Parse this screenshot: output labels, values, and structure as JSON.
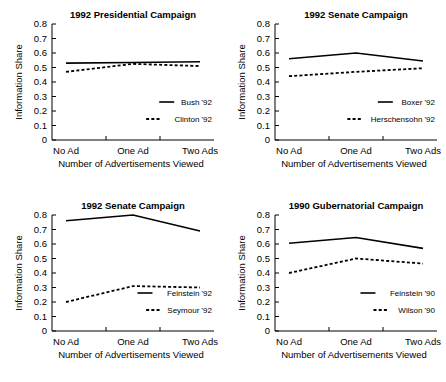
{
  "figure": {
    "panel_count": 4,
    "shared_xlabel": "Number of Advertisements Viewed",
    "shared_ylabel": "Information Share",
    "shared_categories": [
      "No Ad",
      "One Ad",
      "Two Ads"
    ],
    "shared_yticks": [
      "0",
      "0.1",
      "0.2",
      "0.3",
      "0.4",
      "0.5",
      "0.6",
      "0.7",
      "0.8"
    ],
    "line_color": "#000000",
    "background_color": "#ffffff"
  },
  "chart_data": [
    {
      "type": "line",
      "title": "1992 Presidential Campaign",
      "xlabel": "Number of Advertisements Viewed",
      "ylabel": "Information Share",
      "categories": [
        "No Ad",
        "One Ad",
        "Two Ads"
      ],
      "ylim": [
        0,
        0.8
      ],
      "yticks": [
        0,
        0.1,
        0.2,
        0.3,
        0.4,
        0.5,
        0.6,
        0.7,
        0.8
      ],
      "ytick_labels": [
        "0",
        "0.1",
        "0.2",
        "0.3",
        "0.4",
        "0.5",
        "0.6",
        "0.7",
        "0.8"
      ],
      "grid": false,
      "legend_position": "lower right inside",
      "series": [
        {
          "name": "Bush '92",
          "style": "solid",
          "values": [
            0.53,
            0.535,
            0.54
          ]
        },
        {
          "name": "Clinton '92",
          "style": "dashed",
          "values": [
            0.47,
            0.525,
            0.51
          ]
        }
      ]
    },
    {
      "type": "line",
      "title": "1992 Senate Campaign",
      "xlabel": "Number of Advertisements Viewed",
      "ylabel": "Information Share",
      "categories": [
        "No Ad",
        "One Ad",
        "Two Ads"
      ],
      "ylim": [
        0,
        0.8
      ],
      "yticks": [
        0,
        0.1,
        0.2,
        0.3,
        0.4,
        0.5,
        0.6,
        0.7,
        0.8
      ],
      "ytick_labels": [
        "0",
        "0.1",
        "0.2",
        "0.3",
        "0.4",
        "0.5",
        "0.6",
        "0.7",
        "0.8"
      ],
      "grid": false,
      "legend_position": "lower right inside",
      "series": [
        {
          "name": "Boxer '92",
          "style": "solid",
          "values": [
            0.56,
            0.6,
            0.545
          ]
        },
        {
          "name": "Herschensohn '92",
          "style": "dashed",
          "values": [
            0.44,
            0.47,
            0.495
          ]
        }
      ]
    },
    {
      "type": "line",
      "title": "1992 Senate Campaign",
      "xlabel": "Number of Advertisements Viewed",
      "ylabel": "Information Share",
      "categories": [
        "No Ad",
        "One Ad",
        "Two Ads"
      ],
      "ylim": [
        0,
        0.8
      ],
      "yticks": [
        0,
        0.1,
        0.2,
        0.3,
        0.4,
        0.5,
        0.6,
        0.7,
        0.8
      ],
      "ytick_labels": [
        "0",
        "0.1",
        "0.2",
        "0.3",
        "0.4",
        "0.5",
        "0.6",
        "0.7",
        "0.8"
      ],
      "grid": false,
      "legend_position": "lower right inside",
      "series": [
        {
          "name": "Feinstein '92",
          "style": "solid",
          "values": [
            0.76,
            0.8,
            0.69
          ]
        },
        {
          "name": "Seymour '92",
          "style": "dashed",
          "values": [
            0.2,
            0.31,
            0.3
          ]
        }
      ]
    },
    {
      "type": "line",
      "title": "1990 Gubernatorial Campaign",
      "xlabel": "Number of Advertisements Viewed",
      "ylabel": "Information Share",
      "categories": [
        "No Ad",
        "One Ad",
        "Two Ads"
      ],
      "ylim": [
        0,
        0.8
      ],
      "yticks": [
        0,
        0.1,
        0.2,
        0.3,
        0.4,
        0.5,
        0.6,
        0.7,
        0.8
      ],
      "ytick_labels": [
        "0",
        "0.1",
        "0.2",
        "0.3",
        "0.4",
        "0.5",
        "0.6",
        "0.7",
        "0.8"
      ],
      "grid": false,
      "legend_position": "lower right inside",
      "series": [
        {
          "name": "Feinstein '90",
          "style": "solid",
          "values": [
            0.605,
            0.645,
            0.57
          ]
        },
        {
          "name": "Wilson '90",
          "style": "dashed",
          "values": [
            0.4,
            0.5,
            0.465
          ]
        }
      ]
    }
  ]
}
